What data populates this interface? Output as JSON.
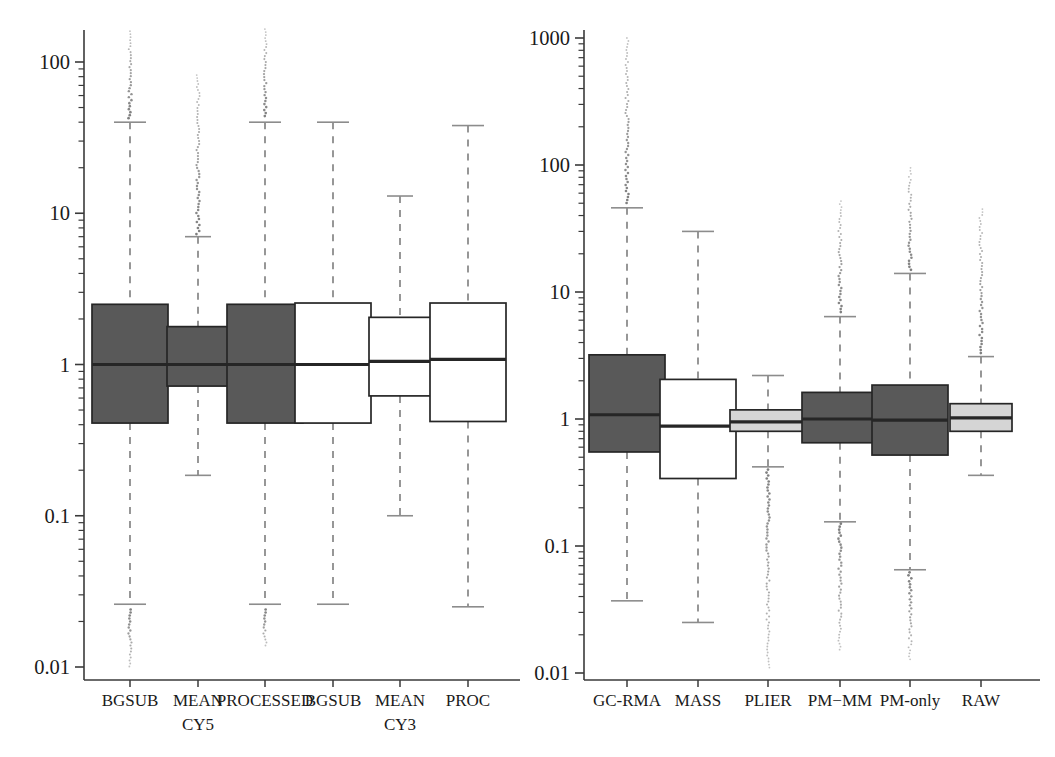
{
  "figure": {
    "background": "#ffffff",
    "colors": {
      "dark_fill": "#595959",
      "light_fill": "#d5d5d5",
      "white_fill": "#ffffff",
      "line": "#262626",
      "dash": "#8c8c8c",
      "outlier": "#737373",
      "axis": "#3a3a3a",
      "text": "#1a1a1a"
    }
  },
  "chart_data": [
    {
      "type": "box",
      "panel": "left",
      "title": "",
      "xlabel": "",
      "ylabel": "",
      "yscale": "log",
      "ylim": [
        0.01,
        200
      ],
      "yticks": [
        0.01,
        0.1,
        1,
        10,
        100
      ],
      "yticklabels": [
        "0.01",
        "0.1",
        "1",
        "10",
        "100"
      ],
      "grid": false,
      "legend": "none",
      "categories": [
        "BGSUB",
        "MEAN",
        "PROCESSED",
        "BGSUB",
        "MEAN",
        "PROC"
      ],
      "sublabels": [
        "",
        "CY5",
        "",
        "",
        "CY3",
        ""
      ],
      "boxes": [
        {
          "label": "BGSUB",
          "sublabel": "",
          "fill": "dark",
          "whisker_low": 0.026,
          "q1": 0.41,
          "median": 1.0,
          "q3": 2.5,
          "whisker_high": 40,
          "outliers_high": [
            42,
            160
          ],
          "outliers_low": [
            0.0098,
            0.024
          ],
          "has_outliers": true
        },
        {
          "label": "MEAN",
          "sublabel": "CY5",
          "fill": "dark",
          "whisker_low": 0.185,
          "q1": 0.72,
          "median": 1.0,
          "q3": 1.78,
          "whisker_high": 7.0,
          "outliers_high": [
            7.2,
            82
          ],
          "outliers_low": [],
          "has_outliers": true
        },
        {
          "label": "PROCESSED",
          "sublabel": "",
          "fill": "dark",
          "whisker_low": 0.026,
          "q1": 0.41,
          "median": 1.0,
          "q3": 2.5,
          "whisker_high": 40,
          "outliers_high": [
            42,
            165
          ],
          "outliers_low": [
            0.0135,
            0.024
          ],
          "has_outliers": true
        },
        {
          "label": "BGSUB",
          "sublabel": "",
          "fill": "white",
          "whisker_low": 0.026,
          "q1": 0.41,
          "median": 1.0,
          "q3": 2.55,
          "whisker_high": 40,
          "outliers_high": [],
          "outliers_low": [],
          "has_outliers": false
        },
        {
          "label": "MEAN",
          "sublabel": "CY3",
          "fill": "white",
          "whisker_low": 0.1,
          "q1": 0.62,
          "median": 1.05,
          "q3": 2.05,
          "whisker_high": 13,
          "outliers_high": [],
          "outliers_low": [],
          "has_outliers": false
        },
        {
          "label": "PROC",
          "sublabel": "",
          "fill": "white",
          "whisker_low": 0.025,
          "q1": 0.42,
          "median": 1.08,
          "q3": 2.55,
          "whisker_high": 38,
          "outliers_high": [],
          "outliers_low": [],
          "has_outliers": false
        }
      ]
    },
    {
      "type": "box",
      "panel": "right",
      "title": "",
      "xlabel": "",
      "ylabel": "",
      "yscale": "log",
      "ylim": [
        0.01,
        1400
      ],
      "yticks": [
        0.01,
        0.1,
        1,
        10,
        100,
        1000
      ],
      "yticklabels": [
        "0.01",
        "0.1",
        "1",
        "10",
        "100",
        "1000"
      ],
      "grid": false,
      "legend": "none",
      "categories": [
        "GC-RMA",
        "MASS",
        "PLIER",
        "PM−MM",
        "PM-only",
        "RAW"
      ],
      "boxes": [
        {
          "label": "GC-RMA",
          "fill": "dark",
          "whisker_low": 0.037,
          "q1": 0.55,
          "median": 1.08,
          "q3": 3.2,
          "whisker_high": 46,
          "outliers_high": [
            48,
            1000
          ],
          "outliers_low": [],
          "has_outliers": true
        },
        {
          "label": "MASS",
          "fill": "white",
          "whisker_low": 0.025,
          "q1": 0.34,
          "median": 0.88,
          "q3": 2.05,
          "whisker_high": 30,
          "outliers_high": [],
          "outliers_low": [],
          "has_outliers": false
        },
        {
          "label": "PLIER",
          "fill": "light",
          "whisker_low": 0.42,
          "q1": 0.8,
          "median": 0.95,
          "q3": 1.18,
          "whisker_high": 2.2,
          "outliers_high": [],
          "outliers_low": [
            0.011,
            0.4
          ],
          "has_outliers": true
        },
        {
          "label": "PM−MM",
          "fill": "dark",
          "whisker_low": 0.155,
          "q1": 0.65,
          "median": 1.0,
          "q3": 1.62,
          "whisker_high": 6.4,
          "outliers_high": [
            6.6,
            52
          ],
          "outliers_low": [
            0.0145,
            0.15
          ],
          "has_outliers": true
        },
        {
          "label": "PM-only",
          "fill": "dark",
          "whisker_low": 0.065,
          "q1": 0.52,
          "median": 0.98,
          "q3": 1.85,
          "whisker_high": 14,
          "outliers_high": [
            14.5,
            95
          ],
          "outliers_low": [
            0.0125,
            0.062
          ],
          "has_outliers": true
        },
        {
          "label": "RAW",
          "fill": "light",
          "whisker_low": 0.36,
          "q1": 0.8,
          "median": 1.02,
          "q3": 1.32,
          "whisker_high": 3.1,
          "outliers_high": [
            3.2,
            45
          ],
          "outliers_low": [],
          "has_outliers": true
        }
      ]
    }
  ]
}
